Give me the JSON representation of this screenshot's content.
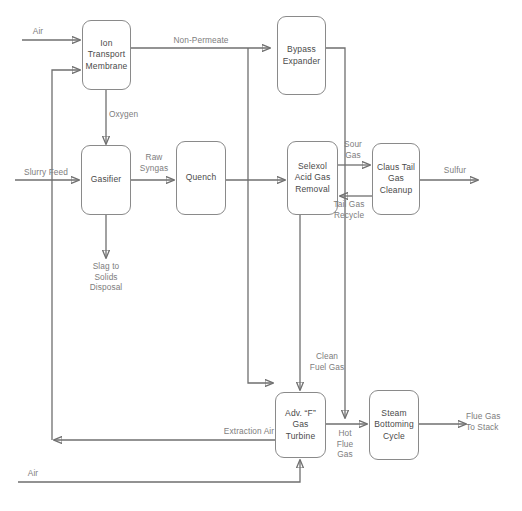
{
  "diagram": {
    "stroke_color": "#6f6f6f",
    "node_border_color": "#8a8a8a",
    "node_text_color": "#4a4a4a",
    "label_text_color": "#7d7d7d",
    "background": "#ffffff"
  },
  "nodes": [
    {
      "id": "itm",
      "label": "Ion\nTransport\nMembrane"
    },
    {
      "id": "bypass",
      "label": "Bypass\nExpander"
    },
    {
      "id": "gasifier",
      "label": "Gasifier"
    },
    {
      "id": "quench",
      "label": "Quench"
    },
    {
      "id": "selexol",
      "label": "Selexol\nAcid Gas\nRemoval"
    },
    {
      "id": "claus",
      "label": "Claus Tail\nGas\nCleanup"
    },
    {
      "id": "turbine",
      "label": "Adv. “F”\nGas\nTurbine"
    },
    {
      "id": "steam",
      "label": "Steam\nBottoming\nCycle"
    }
  ],
  "stream_labels": [
    {
      "id": "air-top",
      "text": "Air"
    },
    {
      "id": "non-permeate",
      "text": "Non-Permeate"
    },
    {
      "id": "oxygen",
      "text": "Oxygen"
    },
    {
      "id": "slurry-feed",
      "text": "Slurry Feed"
    },
    {
      "id": "raw-syngas",
      "text": "Raw\nSyngas"
    },
    {
      "id": "sour-gas",
      "text": "Sour\nGas"
    },
    {
      "id": "tail-gas-recycle",
      "text": "Tail Gas\nRecycle"
    },
    {
      "id": "sulfur",
      "text": "Sulfur"
    },
    {
      "id": "slag-disposal",
      "text": "Slag to\nSolids\nDisposal"
    },
    {
      "id": "clean-fuel-gas",
      "text": "Clean\nFuel Gas"
    },
    {
      "id": "hot-flue-gas",
      "text": "Hot\nFlue\nGas"
    },
    {
      "id": "extraction-air",
      "text": "Extraction Air"
    },
    {
      "id": "flue-gas-stack",
      "text": "Flue Gas\nTo Stack"
    },
    {
      "id": "air-bottom",
      "text": "Air"
    }
  ]
}
